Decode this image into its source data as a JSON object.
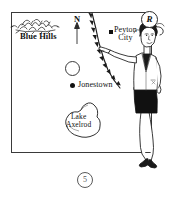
{
  "figure": {
    "number_label": "5",
    "copyright_badge": "R",
    "caption": ""
  },
  "map": {
    "orientation_label": "N",
    "frame_color": "#3a3a3a",
    "background_color": "#ffffff",
    "ink_color": "#111111",
    "places": [
      {
        "name": "Blue Hills",
        "marker": "hills-symbol",
        "label_style": "bold",
        "x": 20,
        "y": 32
      },
      {
        "name": "Peyton City",
        "name_line_1": "Peyton",
        "name_line_2": "City",
        "marker": "square-marker",
        "x": 114,
        "y": 26
      },
      {
        "name": "Jonestown",
        "marker": "dot-marker",
        "x": 78,
        "y": 81
      },
      {
        "name": "Lake Axelrod",
        "name_line_1": "Lake",
        "name_line_2": "Axelrod",
        "marker": "lake-outline",
        "x": 66,
        "y": 113
      }
    ],
    "symbols": [
      {
        "name": "open-circle",
        "description": "unlabeled hollow circle symbol",
        "x": 65,
        "y": 61
      },
      {
        "name": "barbed-boundary-line",
        "description": "curved line with triangular barbs running north to south",
        "x": 90,
        "y": 14
      },
      {
        "name": "north-arrow",
        "description": "vertical arrow pointing up labeled N",
        "x": 74,
        "y": 15
      }
    ]
  },
  "illustration": {
    "name": "woman-pointing",
    "description": "woman in light blazer and dark skirt pointing left toward Peyton City",
    "jacket_color": "#ffffff",
    "skirt_color": "#111111",
    "outline_color": "#1a1a1a"
  }
}
